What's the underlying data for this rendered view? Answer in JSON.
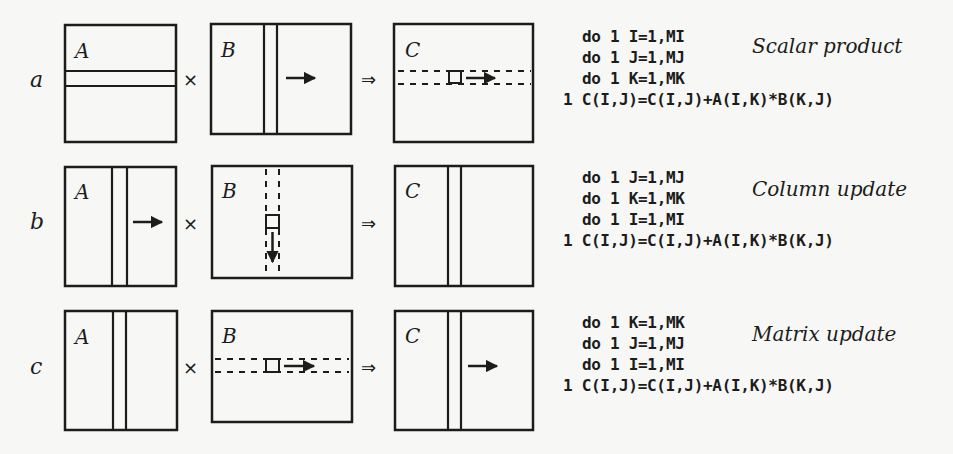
{
  "colors": {
    "ink": "#1c1c1c",
    "paper": "#f7f7f5"
  },
  "operators": {
    "times": "×",
    "implies": "⇒"
  },
  "rows": [
    {
      "label": "a",
      "title": "Scalar product",
      "code": [
        "do 1 I=1,MI",
        "do 1 J=1,MJ",
        "do 1 K=1,MK",
        "1 C(I,J)=C(I,J)+A(I,K)*B(K,J)"
      ],
      "matrices": {
        "A": "A",
        "B": "B",
        "C": "C"
      }
    },
    {
      "label": "b",
      "title": "Column update",
      "code": [
        "do 1 J=1,MJ",
        "do 1 K=1,MK",
        "do 1 I=1,MI",
        "1 C(I,J)=C(I,J)+A(I,K)*B(K,J)"
      ],
      "matrices": {
        "A": "A",
        "B": "B",
        "C": "C"
      }
    },
    {
      "label": "c",
      "title": "Matrix update",
      "code": [
        "do 1 K=1,MK",
        "do 1 J=1,MJ",
        "do 1 I=1,MI",
        "1 C(I,J)=C(I,J)+A(I,K)*B(K,J)"
      ],
      "matrices": {
        "A": "A",
        "B": "B",
        "C": "C"
      }
    }
  ]
}
